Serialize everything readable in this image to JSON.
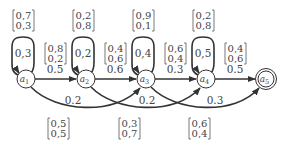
{
  "diagram": {
    "type": "hmm-state-diagram",
    "colors": {
      "stroke": "#333333",
      "text": "#444444",
      "background": "#ffffff"
    },
    "nodes": [
      {
        "id": "a1",
        "base": "a",
        "sub": "1",
        "cx": 26,
        "cy": 79,
        "final": false
      },
      {
        "id": "a2",
        "base": "a",
        "sub": "2",
        "cx": 86,
        "cy": 79,
        "final": false
      },
      {
        "id": "a3",
        "base": "a",
        "sub": "3",
        "cx": 146,
        "cy": 79,
        "final": false
      },
      {
        "id": "a4",
        "base": "a",
        "sub": "4",
        "cx": 206,
        "cy": 79,
        "final": false
      },
      {
        "id": "a5",
        "base": "a",
        "sub": "5",
        "cx": 266,
        "cy": 79,
        "final": true
      }
    ],
    "self_loops": [
      {
        "node": "a1",
        "prob": "0,3",
        "emission": [
          "0,7",
          "0,3"
        ]
      },
      {
        "node": "a2",
        "prob": "0,2",
        "emission": [
          "0,2",
          "0,8"
        ]
      },
      {
        "node": "a3",
        "prob": "0,4",
        "emission": [
          "0,9",
          "0,1"
        ]
      },
      {
        "node": "a4",
        "prob": "0,5",
        "emission": [
          "0,2",
          "0,8"
        ]
      }
    ],
    "forward_edges": [
      {
        "from": "a1",
        "to": "a2",
        "prob": "0.5",
        "emission": [
          "0,8",
          "0,2"
        ]
      },
      {
        "from": "a2",
        "to": "a3",
        "prob": "0.6",
        "emission": [
          "0,4",
          "0,6"
        ]
      },
      {
        "from": "a3",
        "to": "a4",
        "prob": "0.3",
        "emission": [
          "0,6",
          "0,4"
        ]
      },
      {
        "from": "a4",
        "to": "a5",
        "prob": "0.5",
        "emission": [
          "0,4",
          "0,6"
        ]
      }
    ],
    "skip_edges": [
      {
        "from": "a1",
        "to": "a3",
        "prob": "0.2",
        "emission": [
          "0,5",
          "0,5"
        ]
      },
      {
        "from": "a2",
        "to": "a4",
        "prob": "0.2",
        "emission": [
          "0,3",
          "0,7"
        ]
      },
      {
        "from": "a3",
        "to": "a5",
        "prob": "0.3",
        "emission": [
          "0,6",
          "0,4"
        ]
      }
    ]
  }
}
